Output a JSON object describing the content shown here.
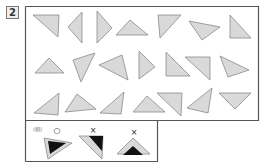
{
  "question": {
    "number": "2"
  },
  "colors": {
    "fill": "#d9d9d9",
    "stroke": "#8a8a8a",
    "frame": "#555555",
    "black": "#111111"
  },
  "triangles": [
    {
      "id": "r1-1",
      "points": "33,15 59,15 58,37"
    },
    {
      "id": "r1-2",
      "points": "68,27 82,12 82,43"
    },
    {
      "id": "r1-3",
      "points": "97,11 97,43 112,28"
    },
    {
      "id": "r1-4",
      "points": "116,35 130,20 148,35"
    },
    {
      "id": "r1-5",
      "points": "158,15 181,15 160,38"
    },
    {
      "id": "r1-6",
      "points": "189,21 220,27 202,40"
    },
    {
      "id": "r1-7",
      "points": "230,15 230,38 251,38"
    },
    {
      "id": "r2-1",
      "points": "35,73 49,58 64,73"
    },
    {
      "id": "r2-2",
      "points": "73,60 95,53 81,82"
    },
    {
      "id": "r2-3",
      "points": "99,65 122,55 128,80"
    },
    {
      "id": "r2-4",
      "points": "139,51 139,79 155,67"
    },
    {
      "id": "r2-5",
      "points": "166,52 166,76 190,76"
    },
    {
      "id": "r2-6",
      "points": "185,57 210,57 210,80"
    },
    {
      "id": "r2-7",
      "points": "220,56 249,70 228,77"
    },
    {
      "id": "r3-1",
      "points": "34,113 59,93 58,115"
    },
    {
      "id": "r3-2",
      "points": "65,112 77,94 96,109"
    },
    {
      "id": "r3-3",
      "points": "100,113 124,92 121,114"
    },
    {
      "id": "r3-4",
      "points": "133,112 147,96 165,112"
    },
    {
      "id": "r3-5",
      "points": "157,93 182,93 181,116"
    },
    {
      "id": "r3-6",
      "points": "187,108 212,88 208,113"
    },
    {
      "id": "r3-7",
      "points": "219,93 251,93 235,109"
    }
  ],
  "example": {
    "label": "(例)",
    "marks": [
      "○",
      "×",
      "×"
    ]
  }
}
